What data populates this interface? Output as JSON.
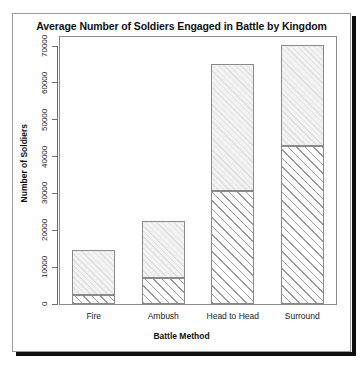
{
  "chart_data": {
    "type": "bar",
    "bar_mode": "stacked",
    "title": "Average Number of Soldiers Engaged in Battle by Kingdom",
    "xlabel": "Battle Method",
    "ylabel": "Number of Soldiers",
    "categories": [
      "Fire",
      "Ambush",
      "Head to Head",
      "Surround"
    ],
    "ylim": [
      0,
      72000
    ],
    "yticks": [
      0,
      10000,
      20000,
      30000,
      40000,
      50000,
      60000,
      70000
    ],
    "ytick_labels": [
      "0",
      "10000",
      "20000",
      "30000",
      "40000",
      "50000",
      "60000",
      "70000"
    ],
    "grid": false,
    "legend": "none",
    "series": [
      {
        "name": "lower-segment",
        "fill": "dark-diagonal-hatch",
        "values": [
          2400,
          7100,
          30600,
          42900
        ]
      },
      {
        "name": "upper-segment",
        "fill": "light-diagonal-hatch",
        "values": [
          12200,
          15400,
          34500,
          27300
        ]
      }
    ],
    "totals": [
      14600,
      22500,
      65100,
      70200
    ]
  },
  "figure": {
    "title": "Average Number of Soldiers Engaged in Battle by Kingdom",
    "x_axis_title": "Battle Method",
    "y_axis_title": "Number of Soldiers"
  },
  "colors": {
    "frame": "#8c8c8c",
    "axis": "#6f6f6f",
    "bar_outline": "#8a8a8a",
    "hatch_dark": "#9b9b9b",
    "hatch_light": "#e0e0e0",
    "panel_border": "#9a9a9a",
    "shadow": "#101010",
    "text": "#111111"
  }
}
